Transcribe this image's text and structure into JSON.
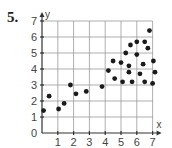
{
  "problem_number": "5.",
  "chart_data": {
    "type": "scatter",
    "title": "",
    "xlabel": "x",
    "ylabel": "y",
    "xlim": [
      0,
      7
    ],
    "ylim": [
      0,
      7
    ],
    "grid": true,
    "x_ticks": [
      "1",
      "2",
      "3",
      "4",
      "5",
      "6",
      "7"
    ],
    "y_ticks": [
      "0",
      "1",
      "2",
      "3",
      "4",
      "5",
      "6",
      "7"
    ],
    "points": [
      {
        "x": 0.1,
        "y": 1.4
      },
      {
        "x": 0.45,
        "y": 2.3
      },
      {
        "x": 1.05,
        "y": 1.5
      },
      {
        "x": 1.4,
        "y": 1.85
      },
      {
        "x": 1.8,
        "y": 3.0
      },
      {
        "x": 2.15,
        "y": 2.45
      },
      {
        "x": 2.8,
        "y": 2.6
      },
      {
        "x": 3.8,
        "y": 2.9
      },
      {
        "x": 6.8,
        "y": 6.4
      },
      {
        "x": 6.0,
        "y": 5.7
      },
      {
        "x": 6.5,
        "y": 5.7
      },
      {
        "x": 5.6,
        "y": 5.5
      },
      {
        "x": 6.7,
        "y": 5.3
      },
      {
        "x": 5.3,
        "y": 5.0
      },
      {
        "x": 6.0,
        "y": 4.9
      },
      {
        "x": 4.5,
        "y": 4.5
      },
      {
        "x": 5.0,
        "y": 4.4
      },
      {
        "x": 5.5,
        "y": 4.2
      },
      {
        "x": 6.4,
        "y": 4.3
      },
      {
        "x": 7.05,
        "y": 4.5
      },
      {
        "x": 4.2,
        "y": 3.9
      },
      {
        "x": 5.5,
        "y": 3.8
      },
      {
        "x": 6.2,
        "y": 3.7
      },
      {
        "x": 7.15,
        "y": 3.8
      },
      {
        "x": 4.6,
        "y": 3.4
      },
      {
        "x": 5.1,
        "y": 3.2
      },
      {
        "x": 5.7,
        "y": 3.2
      },
      {
        "x": 6.5,
        "y": 3.2
      },
      {
        "x": 7.0,
        "y": 3.1
      }
    ]
  }
}
